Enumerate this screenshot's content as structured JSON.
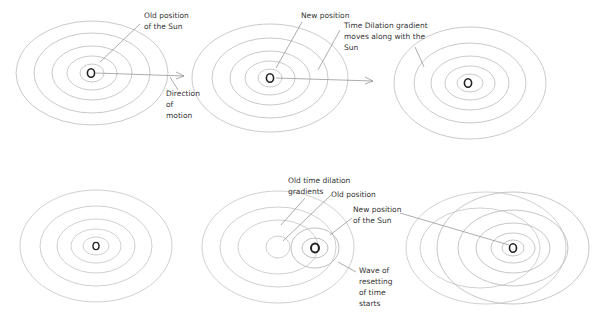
{
  "diagram": {
    "colors": {
      "ring": "#b8b8b8",
      "ring_dark": "#9a9a9a",
      "sun": "#222222",
      "line": "#8a8a8a",
      "text": "#333333"
    },
    "sun_glyph": "O",
    "panels": [
      {
        "id": 1,
        "labels": [
          {
            "name": "old-position-label",
            "text": "Old position\nof the Sun",
            "x": 144,
            "y": 10
          },
          {
            "name": "direction-of-motion-label",
            "text": "Direction\nof\nmotion",
            "x": 166,
            "y": 88
          }
        ]
      },
      {
        "id": 2,
        "labels": [
          {
            "name": "new-position-label",
            "text": "New position",
            "x": 301,
            "y": 10
          },
          {
            "name": "gradient-moves-label",
            "text": "Time Dilation gradient\nmoves along with the\nSun",
            "x": 344,
            "y": 20
          }
        ]
      },
      {
        "id": 3,
        "labels": []
      },
      {
        "id": 4,
        "labels": []
      },
      {
        "id": 5,
        "labels": [
          {
            "name": "old-gradients-label",
            "text": "Old time dilation\ngradients",
            "x": 288,
            "y": 175
          },
          {
            "name": "old-position-label-2",
            "text": "Old position",
            "x": 331,
            "y": 189
          },
          {
            "name": "new-position-sun-label",
            "text": "New position\nof the Sun",
            "x": 353,
            "y": 204
          },
          {
            "name": "wave-resetting-label",
            "text": "Wave of\nresetting\nof time\nstarts",
            "x": 359,
            "y": 265
          }
        ]
      },
      {
        "id": 6,
        "labels": []
      }
    ]
  }
}
